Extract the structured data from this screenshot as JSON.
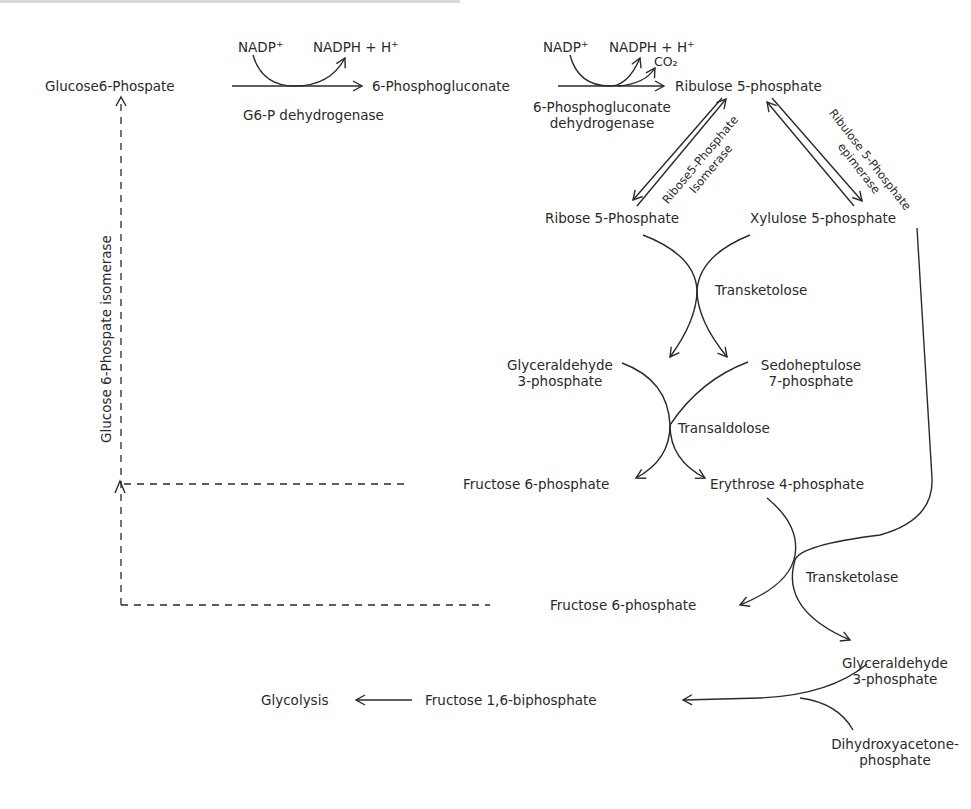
{
  "diagram": {
    "metabolites": {
      "glucose6p": "Glucose6-Phospate",
      "phosphogluconate": "6-Phosphogluconate",
      "ribulose5p": "Ribulose 5-phosphate",
      "ribose5p": "Ribose 5-Phosphate",
      "xylulose5p": "Xylulose 5-phosphate",
      "g3p_1_line1": "Glyceraldehyde",
      "g3p_1_line2": "3-phosphate",
      "s7p_line1": "Sedoheptulose",
      "s7p_line2": "7-phosphate",
      "f6p_1": "Fructose 6-phosphate",
      "e4p": "Erythrose 4-phosphate",
      "f6p_2": "Fructose 6-phosphate",
      "g3p_2_line1": "Glyceraldehyde",
      "g3p_2_line2": "3-phosphate",
      "f16bp": "Fructose 1,6-biphosphate",
      "glycolysis": "Glycolysis",
      "dhap_line1": "Dihydroxyacetone-",
      "dhap_line2": "phosphate"
    },
    "cofactors": {
      "step1_in": "NADP",
      "step1_in_sup": "+",
      "step1_out": "NADPH + H",
      "step1_out_sup": "+",
      "step2_in": "NADP",
      "step2_in_sup": "+",
      "step2_out": "NADPH + H",
      "step2_out_sup": "+",
      "step2_co2": "CO₂"
    },
    "enzymes": {
      "g6pdh": "G6-P dehydrogenase",
      "pgdh_line1": "6-Phosphogluconate",
      "pgdh_line2": "dehydrogenase",
      "rpi_line1": "Ribose5-Phosphate",
      "rpi_line2": "Isomerase",
      "rpe_line1": "Ribulose 5-Phosphate",
      "rpe_line2": "epimerase",
      "transketolose": "Transketolose",
      "transaldolose": "Transaldolose",
      "transketolase": "Transketolase",
      "gpi": "Glucose 6-Phospate isomerase"
    },
    "colors": {
      "line": "#2a2a2a",
      "text": "#2a2a2a",
      "background": "#ffffff"
    }
  }
}
